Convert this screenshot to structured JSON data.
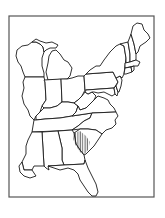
{
  "map": {
    "title": "",
    "region": "Eastern United States",
    "style": "black outline map, white fill",
    "highlighted_region": {
      "name": "hatched-area",
      "location": "eastern Georgia / western South Carolina border region",
      "pattern": "vertical hatching"
    },
    "states": [
      "Wisconsin",
      "Michigan",
      "Illinois",
      "Indiana",
      "Ohio",
      "Kentucky",
      "Tennessee",
      "Mississippi",
      "Alabama",
      "Georgia",
      "Florida",
      "South Carolina",
      "North Carolina",
      "Virginia",
      "West Virginia",
      "Maryland",
      "Delaware",
      "Pennsylvania",
      "New Jersey",
      "New York",
      "Connecticut",
      "Rhode Island",
      "Massachusetts",
      "Vermont",
      "New Hampshire",
      "Maine"
    ],
    "colors": {
      "background": "#ffffff",
      "outline": "#1a1a1a",
      "frame": "#555555"
    }
  }
}
